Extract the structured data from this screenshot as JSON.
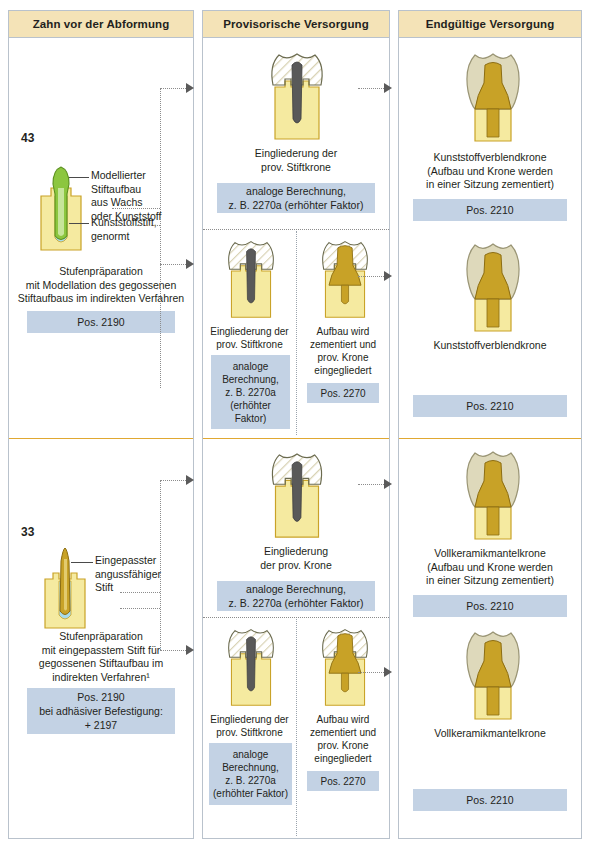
{
  "columns": {
    "left": {
      "title": "Zahn vor der Abformung"
    },
    "middle": {
      "title": "Provisorische Versorgung"
    },
    "right": {
      "title": "Endgültige Versorgung"
    }
  },
  "colors": {
    "header_bg": "#f4e3b7",
    "price_box_bg": "#c3d2e4",
    "section_divider": "#e0a832",
    "column_border": "#b9c2cc",
    "root_yellow": "#f5eaa0",
    "root_outline": "#c9a227",
    "metal_gold": "#c8a227",
    "wax_green": "#8cc63f",
    "post_gray": "#595959",
    "crown_cream": "#ded9bb",
    "apex_blue": "#a9dbe8"
  },
  "section_top": {
    "tooth_number": "43",
    "leaders": [
      {
        "name": "wax-post-buildup",
        "text": "Modellierter\nStiftaufbau\naus Wachs\noder Kunststoff"
      },
      {
        "name": "plastic-post",
        "text": "Kunststoffstift,\ngenormt"
      }
    ],
    "caption": "Stufenpräparation\nmit Modellation des gegossenen\nStiftaufbaus im indirekten Verfahren",
    "pos": "Pos. 2190",
    "rows": [
      {
        "id": "row1",
        "middle": [
          {
            "caption": "Eingliederung der\nprov. Stiftkrone",
            "pos": "analoge Berechnung,\nz. B. 2270a (erhöhter Faktor)",
            "tooth": "prov-post-crown"
          }
        ],
        "right": {
          "caption": "Kunststoffverblendkrone\n(Aufbau und Krone werden\nin einer Sitzung zementiert)",
          "pos": "Pos. 2210",
          "tooth": "final-crown-post"
        }
      },
      {
        "id": "row2",
        "middle": [
          {
            "caption": "Eingliederung der\nprov. Stiftkrone",
            "pos": "analoge\nBerechnung,\nz. B. 2270a\n(erhöhter\nFaktor)",
            "tooth": "prov-post-crown"
          },
          {
            "caption": "Aufbau wird\nzementiert und\nprov. Krone\neingegliedert",
            "pos": "Pos. 2270",
            "tooth": "cemented-core-crown"
          }
        ],
        "right": {
          "caption": "Kunststoffverblendkrone",
          "pos": "Pos. 2210",
          "tooth": "final-crown-core"
        }
      }
    ]
  },
  "section_bottom": {
    "tooth_number": "33",
    "leaders": [
      {
        "name": "fitted-castable-post",
        "text": "Eingepasster\nangussfähiger\nStift"
      }
    ],
    "caption": "Stufenpräparation\nmit eingepasstem Stift für\ngegossenen Stiftaufbau im\nindirekten Verfahren¹",
    "pos": "Pos. 2190\nbei adhäsiver Befestigung:\n+ 2197",
    "rows": [
      {
        "id": "row3",
        "middle": [
          {
            "caption": "Eingliederung\nder prov. Krone",
            "pos": "analoge Berechnung,\nz. B. 2270a (erhöhter Faktor)",
            "tooth": "prov-post-crown"
          }
        ],
        "right": {
          "caption": "Vollkeramikmantelkrone\n(Aufbau und Krone werden\nin einer Sitzung zementiert)",
          "pos": "Pos. 2210",
          "tooth": "final-crown-post"
        }
      },
      {
        "id": "row4",
        "middle": [
          {
            "caption": "Eingliederung der\nprov. Stiftkrone",
            "pos": "analoge\nBerechnung,\nz. B. 2270a\n(erhöhter Faktor)",
            "tooth": "prov-post-crown"
          },
          {
            "caption": "Aufbau wird\nzementiert und\nprov. Krone\neingegliedert",
            "pos": "Pos. 2270",
            "tooth": "cemented-core-crown"
          }
        ],
        "right": {
          "caption": "Vollkeramikmantelkrone",
          "pos": "Pos. 2210",
          "tooth": "final-crown-core"
        }
      }
    ]
  }
}
